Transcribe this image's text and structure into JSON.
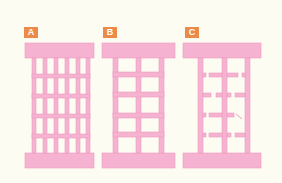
{
  "diagram": {
    "type": "structural-frame-comparison",
    "colors": {
      "background": "#fdfcf2",
      "member": "#f6b3d1",
      "member_stroke": "#ee9cc2",
      "label_bg": "#ec8a4a",
      "label_text": "#ffffff"
    },
    "panels": [
      {
        "id": "A",
        "label": "A",
        "description": "Dense grid frame: 6 vertical members, 4 intermediate horizontal members, 5x5 openings"
      },
      {
        "id": "B",
        "label": "B",
        "description": "Frame with 3 vertical members and 4 intermediate horizontal members, 2x5 large openings"
      },
      {
        "id": "C",
        "label": "C",
        "description": "Frame with 3 vertical members; horizontal members broken/damaged with gaps"
      }
    ]
  }
}
